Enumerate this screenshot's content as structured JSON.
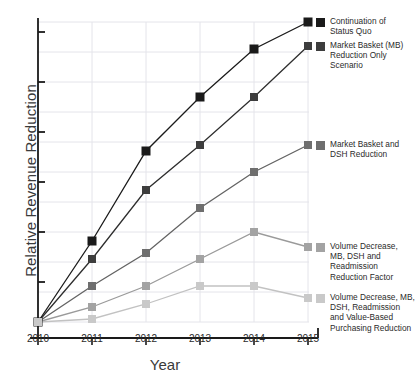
{
  "chart_data": {
    "type": "line",
    "title": "",
    "subtitle": "",
    "xlabel": "Year",
    "ylabel": "Relative Revenue Reduction",
    "categories": [
      "2010",
      "2011",
      "2012",
      "2013",
      "2014",
      "2015"
    ],
    "x": [
      2010,
      2011,
      2012,
      2013,
      2014,
      2015
    ],
    "xlim": [
      2010,
      2015
    ],
    "ylim": [
      0,
      100
    ],
    "y_tick_labels": [],
    "y_axis_has_numeric_labels": false,
    "y_major_tick_count": 6,
    "grid": true,
    "grid_orientation": "both",
    "legend_position": "right-inline-at-line-ends",
    "marker": "square",
    "series": [
      {
        "name": "Continuation of Status Quo",
        "legend_label": "Continuation of\nStatus Quo",
        "color": "#1a1a1a",
        "line_color": "#1a1a1a",
        "values": [
          0,
          27,
          57,
          75,
          91,
          100
        ]
      },
      {
        "name": "Market Basket (MB) Reduction Only Scenario",
        "legend_label": "Market Basket (MB)\nReduction Only\nScenario",
        "color": "#3d3d3d",
        "line_color": "#2e2e2e",
        "values": [
          0,
          21,
          44,
          59,
          75,
          92
        ]
      },
      {
        "name": "Market Basket and DSH Reduction",
        "legend_label": "Market Basket and\nDSH Reduction",
        "color": "#6e6e6e",
        "line_color": "#636363",
        "values": [
          0,
          12,
          23,
          38,
          50,
          59
        ]
      },
      {
        "name": "Volume Decrease, MB, DSH and Readmission Reduction Factor",
        "legend_label": "Volume Decrease,\nMB, DSH and\nReadmission\nReduction Factor",
        "color": "#a3a3a3",
        "line_color": "#9a9a9a",
        "values": [
          0,
          5,
          12,
          21,
          30,
          25
        ]
      },
      {
        "name": "Volume Decrease, MB, DSH, Readmission and Value-Based Purchasing Reduction",
        "legend_label": "Volume Decrease, MB,\nDSH, Readmission\nand Value-Based\nPurchasing Reduction",
        "color": "#c9c9c9",
        "line_color": "#c2c2c2",
        "values": [
          0,
          1,
          6,
          12,
          12,
          8
        ]
      }
    ]
  },
  "axes": {
    "y_title": "Relative Revenue Reduction",
    "x_title": "Year"
  },
  "x_ticks": [
    {
      "label": "2010"
    },
    {
      "label": "2011"
    },
    {
      "label": "2012"
    },
    {
      "label": "2013"
    },
    {
      "label": "2014"
    },
    {
      "label": "2015"
    }
  ],
  "legend": [
    {
      "line1": "Continuation of",
      "line2": "Status Quo",
      "line3": "",
      "line4": ""
    },
    {
      "line1": "Market Basket (MB)",
      "line2": "Reduction Only",
      "line3": "Scenario",
      "line4": ""
    },
    {
      "line1": "Market Basket and",
      "line2": "DSH Reduction",
      "line3": "",
      "line4": ""
    },
    {
      "line1": "Volume Decrease,",
      "line2": "MB, DSH and",
      "line3": "Readmission",
      "line4": "Reduction Factor"
    },
    {
      "line1": "Volume Decrease, MB,",
      "line2": "DSH, Readmission",
      "line3": "and Value-Based",
      "line4": "Purchasing Reduction"
    }
  ],
  "colors": {
    "axis": "#1a1a1a",
    "grid": "#e4e4ea",
    "background": "#ffffff",
    "series_1": "#1a1a1a",
    "series_2": "#3d3d3d",
    "series_3": "#6e6e6e",
    "series_4": "#a3a3a3",
    "series_5": "#c9c9c9"
  }
}
